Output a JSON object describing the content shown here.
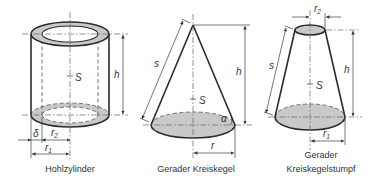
{
  "figures": {
    "hollow_cylinder": {
      "caption": "Hohlzylinder",
      "labels": {
        "h": "h",
        "S": "S",
        "delta": "δ",
        "r2": "r",
        "r2_sub": "2",
        "r1": "r",
        "r1_sub": "1"
      }
    },
    "cone": {
      "caption": "Gerader Kreiskegel",
      "labels": {
        "s": "s",
        "h": "h",
        "S": "S",
        "alpha": "α",
        "r": "r"
      }
    },
    "frustum": {
      "caption_line1": "Gerader",
      "caption_line2": "Kreiskegelstumpf",
      "labels": {
        "s": "s",
        "h": "h",
        "S": "S",
        "r2": "r",
        "r2_sub": "2",
        "r1": "r",
        "r1_sub": "1"
      }
    }
  },
  "colors": {
    "shade": "#c9c9c9",
    "line": "#2b2b2b",
    "background": "#ffffff"
  }
}
